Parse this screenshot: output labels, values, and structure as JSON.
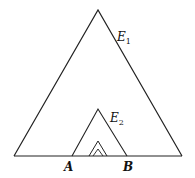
{
  "diagram": {
    "type": "nested-triangles",
    "labels": {
      "e1": {
        "main": "E",
        "sub": "1"
      },
      "e2": {
        "main": "E",
        "sub": "2"
      },
      "a": "A",
      "b": "B"
    },
    "stroke_color": "#222222",
    "baseline": {
      "x1": 14,
      "x2": 182,
      "y": 156
    },
    "triangles": [
      {
        "name": "E1",
        "apex": [
          98,
          10
        ],
        "left": [
          14,
          156
        ],
        "right": [
          182,
          156
        ]
      },
      {
        "name": "E2",
        "apex": [
          98,
          109
        ],
        "left": [
          72,
          156
        ],
        "right": [
          127,
          156
        ]
      },
      {
        "name": "E3",
        "apex": [
          98,
          141
        ],
        "left": [
          89,
          156
        ],
        "right": [
          107,
          156
        ]
      },
      {
        "name": "E4",
        "apex": [
          98,
          149
        ],
        "left": [
          93,
          156
        ],
        "right": [
          103,
          156
        ]
      }
    ]
  }
}
